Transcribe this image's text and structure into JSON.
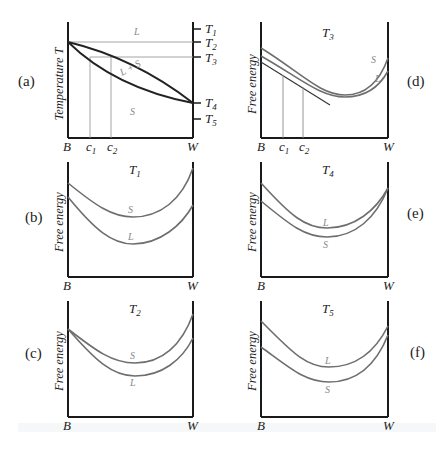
{
  "figure": {
    "panels": {
      "a": {
        "tag": "(a)",
        "y_axis_label": "Temperature T",
        "x_left": "B",
        "x_right": "W",
        "c1": "c",
        "c1_sub": "1",
        "c2": "c",
        "c2_sub": "2",
        "region_L": "L",
        "region_LS": "L + S",
        "region_S": "S",
        "temps": [
          {
            "label": "T",
            "sub": "1"
          },
          {
            "label": "T",
            "sub": "2"
          },
          {
            "label": "T",
            "sub": "3"
          },
          {
            "label": "T",
            "sub": "4"
          },
          {
            "label": "T",
            "sub": "5"
          }
        ]
      },
      "b": {
        "tag": "(b)",
        "title": "T",
        "title_sub": "1",
        "y_axis_label": "Free energy",
        "x_left": "B",
        "x_right": "W",
        "curve_upper": "S",
        "curve_lower": "L"
      },
      "c": {
        "tag": "(c)",
        "title": "T",
        "title_sub": "2",
        "y_axis_label": "Free energy",
        "x_left": "B",
        "x_right": "W",
        "curve_upper": "S",
        "curve_lower": "L"
      },
      "d": {
        "tag": "(d)",
        "title": "T",
        "title_sub": "3",
        "y_axis_label": "Free energy",
        "x_left": "B",
        "x_right": "W",
        "curve_upper": "S",
        "curve_lower": "L",
        "c1": "c",
        "c1_sub": "1",
        "c2": "c",
        "c2_sub": "2"
      },
      "e": {
        "tag": "(e)",
        "title": "T",
        "title_sub": "4",
        "y_axis_label": "Free energy",
        "x_left": "B",
        "x_right": "W",
        "curve_upper": "L",
        "curve_lower": "S"
      },
      "f": {
        "tag": "(f)",
        "title": "T",
        "title_sub": "5",
        "y_axis_label": "Free energy",
        "x_left": "B",
        "x_right": "W",
        "curve_upper": "L",
        "curve_lower": "S"
      }
    },
    "colors": {
      "axis": "#1a1a1a",
      "curve": "#6e6e6e",
      "guide": "#9a9a9a",
      "region_text": "#888888"
    }
  }
}
